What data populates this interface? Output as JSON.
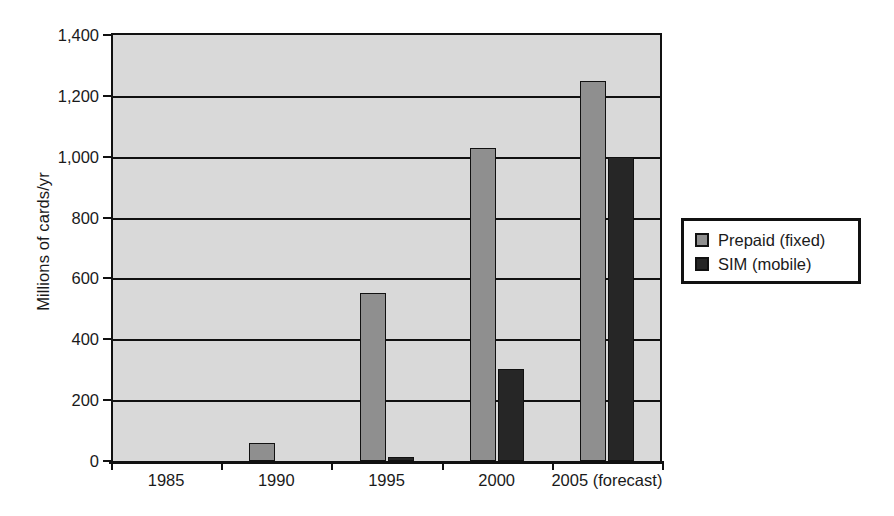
{
  "chart_data": {
    "type": "bar",
    "title": "",
    "xlabel": "",
    "ylabel": "Millions of cards/yr",
    "categories": [
      "1985",
      "1990",
      "1995",
      "2000",
      "2005 (forecast)"
    ],
    "ylim": [
      0,
      1400
    ],
    "yticks": [
      "0",
      "200",
      "400",
      "600",
      "800",
      "1,000",
      "1,200",
      "1,400"
    ],
    "ytick_values": [
      0,
      200,
      400,
      600,
      800,
      1000,
      1200,
      1400
    ],
    "grid": true,
    "legend_position": "right",
    "series": [
      {
        "name": "Prepaid (fixed)",
        "color": "#8f8f8f",
        "values": [
          0,
          60,
          552,
          1030,
          1250
        ]
      },
      {
        "name": "SIM (mobile)",
        "color": "#262626",
        "values": [
          0,
          0,
          12,
          303,
          1000
        ]
      }
    ]
  },
  "legend": {
    "items": [
      {
        "label": "Prepaid (fixed)",
        "swatch": "prepaid"
      },
      {
        "label": "SIM (mobile)",
        "swatch": "sim"
      }
    ]
  },
  "colors": {
    "plot_background": "#d9d9d9",
    "axis": "#111111",
    "prepaid": "#8f8f8f",
    "sim": "#262626"
  }
}
